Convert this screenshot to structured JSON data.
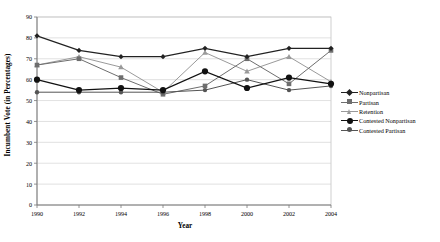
{
  "chart_data": {
    "type": "line",
    "title": "",
    "xlabel": "Year",
    "ylabel": "Incumbent Vote (in Percentages)",
    "x": [
      1990,
      1992,
      1994,
      1996,
      1998,
      2000,
      2002,
      2004
    ],
    "xticklabels": [
      "1990",
      "1992",
      "1994",
      "1996",
      "1998",
      "2000",
      "2002",
      "2004"
    ],
    "yticklabels": [
      "0",
      "10",
      "20",
      "30",
      "40",
      "50",
      "60",
      "70",
      "80",
      "90"
    ],
    "yticks": [
      0,
      10,
      20,
      30,
      40,
      50,
      60,
      70,
      80,
      90
    ],
    "ylim": [
      0,
      90
    ],
    "xlim": [
      1990,
      2004
    ],
    "grid": "horizontal",
    "legend_position": "right",
    "series": [
      {
        "name": "Nonpartisan",
        "marker": "diamond",
        "color": "#222222",
        "values": [
          81,
          74,
          71,
          71,
          75,
          71,
          75,
          75
        ]
      },
      {
        "name": "Partisan",
        "marker": "square",
        "color": "#6e6e6e",
        "values": [
          67,
          70,
          61,
          53,
          57,
          70,
          58,
          74
        ]
      },
      {
        "name": "Retention",
        "marker": "triangle",
        "color": "#9a9a9a",
        "values": [
          67,
          71,
          66,
          54,
          73,
          64,
          71,
          59
        ]
      },
      {
        "name": "Contested Nonpartisan",
        "marker": "circle-filled",
        "color": "#111111",
        "values": [
          60,
          55,
          56,
          55,
          64,
          56,
          61,
          58
        ]
      },
      {
        "name": "Contested Partisan",
        "marker": "circle",
        "color": "#555555",
        "values": [
          54,
          54,
          54,
          54,
          55,
          60,
          55,
          57
        ]
      }
    ]
  },
  "legend": {
    "items": [
      "Nonpartisan",
      "Partisan",
      "Retention",
      "Contested Nonpartisan",
      "Contested Partisan"
    ]
  }
}
